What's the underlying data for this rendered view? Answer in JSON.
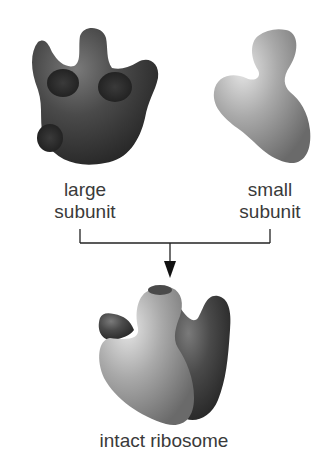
{
  "diagram": {
    "large_subunit": {
      "label_line1": "large",
      "label_line2": "subunit",
      "color": "#3f3f3f"
    },
    "small_subunit": {
      "label_line1": "small",
      "label_line2": "subunit",
      "color": "#9a9a9a"
    },
    "result": {
      "label": "intact ribosome"
    },
    "connector_color": "#222222"
  }
}
